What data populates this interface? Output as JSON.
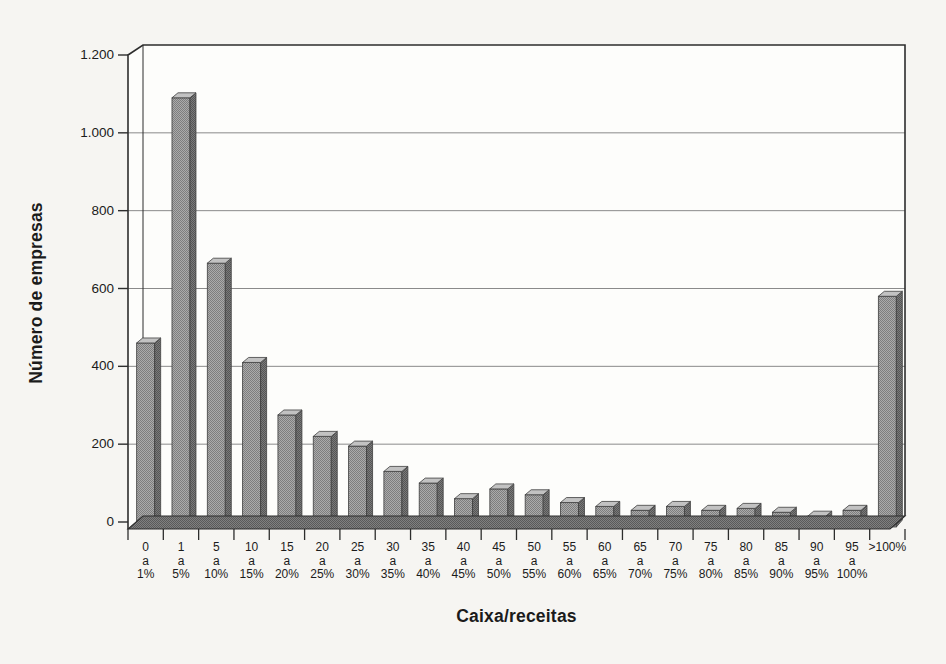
{
  "figure": {
    "background": "#f6f5f2",
    "plot_background": "#fdfdfb"
  },
  "chart_data": {
    "type": "bar",
    "title": "",
    "xlabel": "Caixa/receitas",
    "ylabel": "Número de empresas",
    "categories": [
      "0 a 1%",
      "1 a 5%",
      "5 a 10%",
      "10 a 15%",
      "15 a 20%",
      "20 a 25%",
      "25 a 30%",
      "30 a 35%",
      "35 a 40%",
      "40 a 45%",
      "45 a 50%",
      "50 a 55%",
      "55 a 60%",
      "60 a 65%",
      "65 a 70%",
      "70 a 75%",
      "75 a 80%",
      "80 a 85%",
      "85 a 90%",
      "90 a 95%",
      "95 a 100%",
      ">100%"
    ],
    "category_tick_lines": [
      [
        "0",
        "a",
        "1%"
      ],
      [
        "1",
        "a",
        "5%"
      ],
      [
        "5",
        "a",
        "10%"
      ],
      [
        "10",
        "a",
        "15%"
      ],
      [
        "15",
        "a",
        "20%"
      ],
      [
        "20",
        "a",
        "25%"
      ],
      [
        "25",
        "a",
        "30%"
      ],
      [
        "30",
        "a",
        "35%"
      ],
      [
        "35",
        "a",
        "40%"
      ],
      [
        "40",
        "a",
        "45%"
      ],
      [
        "45",
        "a",
        "50%"
      ],
      [
        "50",
        "a",
        "55%"
      ],
      [
        "55",
        "a",
        "60%"
      ],
      [
        "60",
        "a",
        "65%"
      ],
      [
        "65",
        "a",
        "70%"
      ],
      [
        "70",
        "a",
        "75%"
      ],
      [
        "75",
        "a",
        "80%"
      ],
      [
        "80",
        "a",
        "85%"
      ],
      [
        "85",
        "a",
        "90%"
      ],
      [
        "90",
        "a",
        "95%"
      ],
      [
        "95",
        "a",
        "100%"
      ],
      [
        ">100%"
      ]
    ],
    "values": [
      460,
      1090,
      665,
      410,
      275,
      220,
      195,
      130,
      100,
      60,
      85,
      70,
      50,
      40,
      30,
      40,
      30,
      35,
      25,
      15,
      30,
      580
    ],
    "ylim": [
      0,
      1200
    ],
    "ytick_values": [
      0,
      200,
      400,
      600,
      800,
      1000,
      1200
    ],
    "ytick_labels": [
      "0",
      "200",
      "400",
      "600",
      "800",
      "1.000",
      "1.200"
    ],
    "grid": true,
    "legend": false,
    "style": {
      "effect": "3d-column",
      "bar_front_base": "#ababab",
      "bar_front_dot": "#7e7e7e",
      "bar_side_base": "#7a7a7a",
      "bar_side_dot": "#555555",
      "bar_top": "#c2c2c2",
      "bar_outline": "#3f3f3f",
      "floor_base": "#808080",
      "floor_dot": "#5a5a5a",
      "axis_color": "#2d2d2d",
      "gridline_color": "#8a8a8a",
      "text_color": "#1b1b1b"
    }
  }
}
